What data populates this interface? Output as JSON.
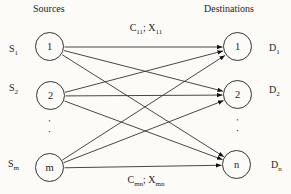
{
  "diagram": {
    "sources_heading": "Sources",
    "destinations_heading": "Destinations",
    "edge_label_top": {
      "cost": "C",
      "cost_sub": "11",
      "separator": "; ",
      "flow": "X",
      "flow_sub": "11"
    },
    "edge_label_bottom": {
      "cost": "C",
      "cost_sub": "mn",
      "separator": "; ",
      "flow": "X",
      "flow_sub": "mn"
    },
    "sources": [
      {
        "id": "s1",
        "supply_base": "S",
        "supply_sub": "1",
        "node_label": "1"
      },
      {
        "id": "s2",
        "supply_base": "S",
        "supply_sub": "2",
        "node_label": "2"
      },
      {
        "id": "sm",
        "supply_base": "S",
        "supply_sub": "m",
        "node_label": "m"
      }
    ],
    "destinations": [
      {
        "id": "d1",
        "demand_base": "D",
        "demand_sub": "1",
        "node_label": "1"
      },
      {
        "id": "d2",
        "demand_base": "D",
        "demand_sub": "2",
        "node_label": "2"
      },
      {
        "id": "dn",
        "demand_base": "D",
        "demand_sub": "n",
        "node_label": "n"
      }
    ],
    "ellipsis": "··",
    "edges": [
      [
        "s1",
        "d1"
      ],
      [
        "s1",
        "d2"
      ],
      [
        "s1",
        "dn"
      ],
      [
        "s2",
        "d1"
      ],
      [
        "s2",
        "d2"
      ],
      [
        "s2",
        "dn"
      ],
      [
        "sm",
        "d1"
      ],
      [
        "sm",
        "d2"
      ],
      [
        "sm",
        "dn"
      ]
    ],
    "colors": {
      "line": "#333333",
      "arrow": "#111111",
      "text": "#1d1d1d",
      "background": "#fcfbf8"
    }
  }
}
